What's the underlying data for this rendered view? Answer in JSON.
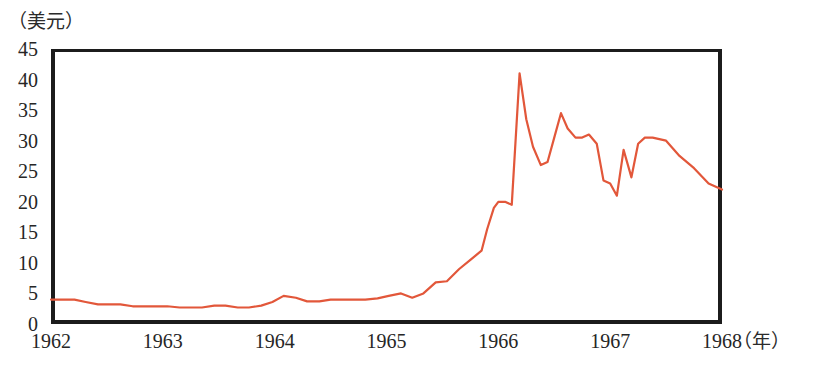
{
  "chart_data": {
    "type": "line",
    "title": "",
    "ylabel": "（美元）",
    "xlabel": "（年）",
    "ylim": [
      0,
      45
    ],
    "xlim": [
      1962,
      1968
    ],
    "grid": false,
    "legend": null,
    "y_ticks": [
      "45",
      "40",
      "35",
      "30",
      "25",
      "20",
      "15",
      "10",
      "5",
      "0"
    ],
    "y_tick_values": [
      45,
      40,
      35,
      30,
      25,
      20,
      15,
      10,
      5,
      0
    ],
    "x_ticks": [
      "1962",
      "1963",
      "1964",
      "1965",
      "1966",
      "1967",
      "1968"
    ],
    "x_tick_values": [
      1962,
      1963,
      1964,
      1965,
      1966,
      1967,
      1968
    ],
    "series": [
      {
        "name": "price",
        "color": "#E2573A",
        "x": [
          1962.0,
          1962.1,
          1962.21,
          1962.31,
          1962.42,
          1962.52,
          1962.62,
          1962.73,
          1962.83,
          1962.94,
          1963.04,
          1963.15,
          1963.25,
          1963.35,
          1963.46,
          1963.56,
          1963.67,
          1963.77,
          1963.88,
          1963.98,
          1964.08,
          1964.19,
          1964.29,
          1964.4,
          1964.5,
          1964.6,
          1964.71,
          1964.81,
          1964.92,
          1965.02,
          1965.13,
          1965.23,
          1965.33,
          1965.44,
          1965.54,
          1965.65,
          1965.75,
          1965.85,
          1965.9,
          1965.96,
          1966.0,
          1966.06,
          1966.12,
          1966.19,
          1966.25,
          1966.31,
          1966.38,
          1966.44,
          1966.5,
          1966.56,
          1966.62,
          1966.69,
          1966.75,
          1966.81,
          1966.88,
          1966.94,
          1967.0,
          1967.06,
          1967.12,
          1967.19,
          1967.25,
          1967.31,
          1967.38,
          1967.5,
          1967.62,
          1967.75,
          1967.88,
          1968.0
        ],
        "y": [
          4.0,
          4.0,
          4.0,
          3.6,
          3.2,
          3.2,
          3.2,
          2.9,
          2.9,
          2.9,
          2.9,
          2.7,
          2.7,
          2.7,
          3.0,
          3.0,
          2.7,
          2.7,
          3.0,
          3.6,
          4.6,
          4.3,
          3.7,
          3.7,
          4.0,
          4.0,
          4.0,
          4.0,
          4.2,
          4.6,
          5.0,
          4.3,
          5.0,
          6.8,
          7.0,
          9.0,
          10.5,
          12.0,
          15.5,
          19.0,
          20.0,
          20.0,
          19.5,
          41.0,
          33.5,
          29.0,
          26.0,
          26.5,
          30.5,
          34.5,
          32.0,
          30.5,
          30.5,
          31.0,
          29.5,
          23.5,
          23.0,
          21.0,
          28.5,
          24.0,
          29.5,
          30.5,
          30.5,
          30.0,
          27.5,
          25.5,
          23.0,
          22.0
        ]
      }
    ]
  },
  "axes": {
    "unit_label": "（美元）",
    "x_unit_label": "（年）"
  }
}
